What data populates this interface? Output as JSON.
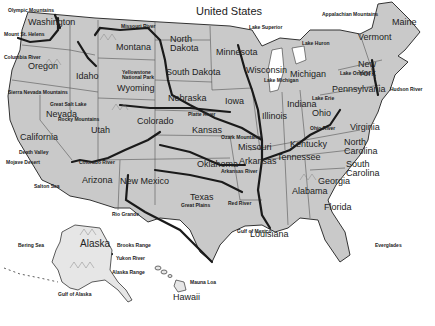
{
  "title": "United States",
  "colors": {
    "land": "#c9c9c9",
    "border": "#555555",
    "river": "#1a1a1a",
    "water": "#ffffff"
  },
  "states": [
    {
      "name": "Washington",
      "x": 28,
      "y": 18
    },
    {
      "name": "Oregon",
      "x": 28,
      "y": 62
    },
    {
      "name": "California",
      "x": 20,
      "y": 133
    },
    {
      "name": "Idaho",
      "x": 76,
      "y": 72
    },
    {
      "name": "Nevada",
      "x": 46,
      "y": 110
    },
    {
      "name": "Montana",
      "x": 116,
      "y": 43
    },
    {
      "name": "Wyoming",
      "x": 117,
      "y": 84
    },
    {
      "name": "Utah",
      "x": 91,
      "y": 126
    },
    {
      "name": "Colorado",
      "x": 137,
      "y": 117
    },
    {
      "name": "Arizona",
      "x": 82,
      "y": 176
    },
    {
      "name": "New Mexico",
      "x": 120,
      "y": 177
    },
    {
      "name": "North Dakota",
      "x": 170,
      "y": 35
    },
    {
      "name": "South Dakota",
      "x": 166,
      "y": 68
    },
    {
      "name": "Nebraska",
      "x": 168,
      "y": 94
    },
    {
      "name": "Kansas",
      "x": 192,
      "y": 126
    },
    {
      "name": "Oklahoma",
      "x": 197,
      "y": 160
    },
    {
      "name": "Texas",
      "x": 190,
      "y": 193
    },
    {
      "name": "Minnesota",
      "x": 216,
      "y": 48
    },
    {
      "name": "Iowa",
      "x": 225,
      "y": 97
    },
    {
      "name": "Missouri",
      "x": 238,
      "y": 143
    },
    {
      "name": "Arkansas",
      "x": 239,
      "y": 157
    },
    {
      "name": "Louisiana",
      "x": 250,
      "y": 230
    },
    {
      "name": "Wisconsin",
      "x": 246,
      "y": 66
    },
    {
      "name": "Illinois",
      "x": 262,
      "y": 112
    },
    {
      "name": "Michigan",
      "x": 290,
      "y": 70
    },
    {
      "name": "Indiana",
      "x": 287,
      "y": 100
    },
    {
      "name": "Ohio",
      "x": 312,
      "y": 109
    },
    {
      "name": "Kentucky",
      "x": 290,
      "y": 140
    },
    {
      "name": "Tennessee",
      "x": 277,
      "y": 153
    },
    {
      "name": "Alabama",
      "x": 292,
      "y": 187
    },
    {
      "name": "Georgia",
      "x": 318,
      "y": 177
    },
    {
      "name": "Florida",
      "x": 324,
      "y": 203
    },
    {
      "name": "South Carolina",
      "x": 346,
      "y": 160
    },
    {
      "name": "North Carolina",
      "x": 344,
      "y": 138
    },
    {
      "name": "Virginia",
      "x": 350,
      "y": 123
    },
    {
      "name": "Pennsylvania",
      "x": 332,
      "y": 85
    },
    {
      "name": "New York",
      "x": 358,
      "y": 60
    },
    {
      "name": "Vermont",
      "x": 358,
      "y": 33
    },
    {
      "name": "Maine",
      "x": 392,
      "y": 18
    },
    {
      "name": "Alaska",
      "x": 80,
      "y": 239
    },
    {
      "name": "Hawaii",
      "x": 173,
      "y": 293
    }
  ],
  "features": [
    {
      "name": "Olympic Mountains",
      "x": 8,
      "y": 8
    },
    {
      "name": "Mount St. Helens",
      "x": 4,
      "y": 32
    },
    {
      "name": "Columbia River",
      "x": 4,
      "y": 55
    },
    {
      "name": "Yellowstone National Park",
      "x": 122,
      "y": 70
    },
    {
      "name": "Great Salt Lake",
      "x": 50,
      "y": 102
    },
    {
      "name": "Sierra Nevada Mountains",
      "x": 8,
      "y": 90
    },
    {
      "name": "Rocky Mountains",
      "x": 58,
      "y": 117
    },
    {
      "name": "Death Valley",
      "x": 19,
      "y": 150
    },
    {
      "name": "Mojave Desert",
      "x": 6,
      "y": 160
    },
    {
      "name": "Colorado River",
      "x": 79,
      "y": 160
    },
    {
      "name": "Salton Sea",
      "x": 34,
      "y": 184
    },
    {
      "name": "Missouri River",
      "x": 121,
      "y": 24
    },
    {
      "name": "Lake Superior",
      "x": 249,
      "y": 25
    },
    {
      "name": "Lake Huron",
      "x": 302,
      "y": 41
    },
    {
      "name": "Lake Michigan",
      "x": 264,
      "y": 78
    },
    {
      "name": "Lake Erie",
      "x": 312,
      "y": 96
    },
    {
      "name": "Lake Ontario",
      "x": 340,
      "y": 71
    },
    {
      "name": "Appalachian Mountains",
      "x": 322,
      "y": 12
    },
    {
      "name": "Hudson River",
      "x": 390,
      "y": 87
    },
    {
      "name": "Platte River",
      "x": 188,
      "y": 112
    },
    {
      "name": "Ozark Mountains",
      "x": 221,
      "y": 135
    },
    {
      "name": "Arkansas River",
      "x": 221,
      "y": 169
    },
    {
      "name": "Ohio River",
      "x": 310,
      "y": 126
    },
    {
      "name": "Great Plains",
      "x": 181,
      "y": 203
    },
    {
      "name": "Red River",
      "x": 228,
      "y": 201
    },
    {
      "name": "Rio Grande",
      "x": 112,
      "y": 212
    },
    {
      "name": "Gulf of Mexico",
      "x": 237,
      "y": 229
    },
    {
      "name": "Everglades",
      "x": 375,
      "y": 243
    },
    {
      "name": "Bering Sea",
      "x": 18,
      "y": 243
    },
    {
      "name": "Brooks Range",
      "x": 117,
      "y": 243
    },
    {
      "name": "Yukon River",
      "x": 116,
      "y": 256
    },
    {
      "name": "Alaska Range",
      "x": 112,
      "y": 270
    },
    {
      "name": "Gulf of Alaska",
      "x": 58,
      "y": 292
    },
    {
      "name": "Mauna Loa",
      "x": 190,
      "y": 280
    }
  ]
}
